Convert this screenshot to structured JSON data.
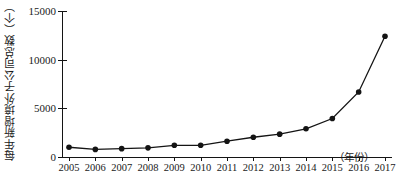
{
  "chart_data": {
    "type": "line",
    "title": "",
    "xlabel": "（年份）",
    "ylabel": "每年新增境外子公司总数（个）",
    "categories": [
      "2005",
      "2006",
      "2007",
      "2008",
      "2009",
      "2010",
      "2011",
      "2012",
      "2013",
      "2014",
      "2015",
      "2016",
      "2017"
    ],
    "values": [
      1000,
      780,
      860,
      940,
      1200,
      1200,
      1620,
      2030,
      2350,
      2900,
      3950,
      6680,
      12400
    ],
    "series": [
      {
        "name": "每年新增境外子公司总数",
        "values": [
          1000,
          780,
          860,
          940,
          1200,
          1200,
          1620,
          2030,
          2350,
          2900,
          3950,
          6680,
          12400
        ]
      }
    ],
    "ylim": [
      0,
      15000
    ],
    "yticks": [
      0,
      5000,
      10000,
      15000
    ],
    "ytick_labels": [
      "0",
      "5000",
      "10000",
      "15000"
    ],
    "xlim": [
      "2005",
      "2017"
    ],
    "grid": false,
    "legend": false,
    "marker": "filled-circle",
    "line_color": "#141414",
    "marker_color": "#141414"
  },
  "axes": {
    "y_title": "每年新增境外子公司总数（个）",
    "x_title": "（年份）"
  }
}
